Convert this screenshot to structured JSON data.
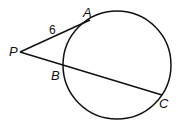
{
  "diagram": {
    "type": "secant-tangent-circle",
    "points": {
      "P": {
        "label": "P",
        "x": 20,
        "y": 52
      },
      "A": {
        "label": "A",
        "x": 89,
        "y": 20
      },
      "B": {
        "label": "B",
        "x": 64,
        "y": 66
      },
      "C": {
        "label": "C",
        "x": 161,
        "y": 95
      }
    },
    "circle": {
      "cx": 117,
      "cy": 65,
      "r": 54
    },
    "segments": [
      {
        "from": "P",
        "to": "A",
        "label": "6"
      },
      {
        "from": "P",
        "to": "C",
        "label": ""
      }
    ],
    "stroke_color": "#111111"
  }
}
